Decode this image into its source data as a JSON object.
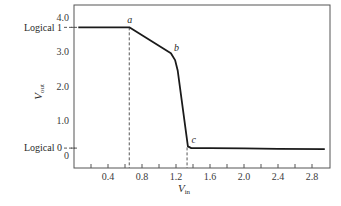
{
  "chart_data": {
    "type": "line",
    "title": "",
    "xlabel": "V_in",
    "xlabel_main": "V",
    "xlabel_sub": "in",
    "ylabel": "V_out",
    "ylabel_main": "V",
    "ylabel_sub": "out",
    "xlim": [
      0,
      3.0
    ],
    "ylim": [
      -0.4,
      4.3
    ],
    "grid": false,
    "legend": null,
    "x_ticks": [
      0.2,
      0.4,
      0.6,
      0.8,
      1.0,
      1.2,
      1.4,
      1.6,
      1.8,
      2.0,
      2.2,
      2.4,
      2.6,
      2.8
    ],
    "x_tick_labels": [
      {
        "value": 0.4,
        "label": "0.4"
      },
      {
        "value": 0.8,
        "label": "0.8"
      },
      {
        "value": 1.2,
        "label": "1.2"
      },
      {
        "value": 1.6,
        "label": "1.6"
      },
      {
        "value": 2.0,
        "label": "2.0"
      },
      {
        "value": 2.4,
        "label": "2.4"
      },
      {
        "value": 2.8,
        "label": "2.8"
      }
    ],
    "y_tick_labels": [
      {
        "value": 4.0,
        "label": "4.0"
      },
      {
        "value": 3.0,
        "label": "3.0"
      },
      {
        "value": 2.0,
        "label": "2.0"
      },
      {
        "value": 1.0,
        "label": "1.0"
      },
      {
        "value": 0,
        "label": "0"
      }
    ],
    "series": [
      {
        "name": "Transfer characteristic",
        "x": [
          0.05,
          0.65,
          1.14,
          1.19,
          1.22,
          1.34,
          1.38,
          1.6,
          2.0,
          2.4,
          2.95
        ],
        "y": [
          3.7,
          3.7,
          2.95,
          2.75,
          2.45,
          0.25,
          0.2,
          0.2,
          0.19,
          0.18,
          0.17
        ]
      }
    ],
    "annotations": [
      {
        "label": "a",
        "x": 0.65,
        "y": 3.7
      },
      {
        "label": "b",
        "x": 1.14,
        "y": 2.95
      },
      {
        "label": "c",
        "x": 1.36,
        "y": 0.22
      }
    ],
    "reference_levels": [
      {
        "label": "Logical 1",
        "y": 3.7
      },
      {
        "label": "Logical 0",
        "y": 0.2
      }
    ],
    "reference_verticals": [
      {
        "x": 0.65
      },
      {
        "x": 1.33
      }
    ]
  },
  "labels": {
    "logical1": "Logical 1",
    "logical0": "Logical 0",
    "point_a": "a",
    "point_b": "b",
    "point_c": "c"
  },
  "style": {
    "line_color": "#1a1a1a",
    "axis_color": "#555555",
    "dash_color": "#444444"
  }
}
